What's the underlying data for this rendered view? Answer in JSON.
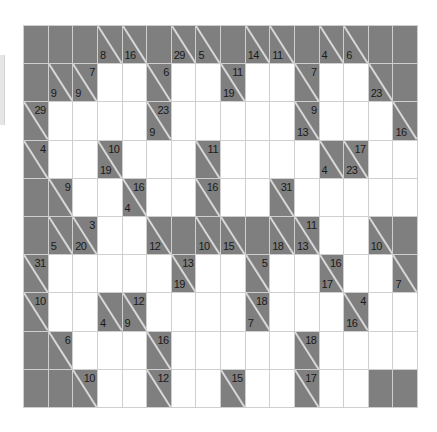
{
  "puzzle": {
    "type": "kakuro",
    "rows": 10,
    "cols": 16,
    "colors": {
      "block": "#7f7f7f",
      "white": "#ffffff",
      "gridline": "#cfcfcf"
    },
    "legend": "Each row is a list of 16 cells. 'B' = blank black cell, 'W' = empty white entry cell, object = clue cell with optional down/right sums.",
    "grid": [
      [
        "B",
        "B",
        "B",
        {
          "down": 8
        },
        {
          "down": 16
        },
        "B",
        {
          "down": 29
        },
        {
          "down": 5
        },
        "B",
        {
          "down": 14
        },
        {
          "down": 11
        },
        "B",
        {
          "down": 4
        },
        {
          "down": 6
        },
        "B",
        "B"
      ],
      [
        "B",
        {
          "down": 9
        },
        {
          "down": 9,
          "right": 7
        },
        "W",
        "W",
        {
          "right": 6
        },
        "W",
        "W",
        {
          "down": 19,
          "right": 11
        },
        "W",
        "W",
        {
          "right": 7
        },
        "W",
        "W",
        {
          "down": 23
        },
        "B"
      ],
      [
        {
          "right": 29
        },
        "W",
        "W",
        "W",
        "W",
        {
          "down": 9,
          "right": 23
        },
        "W",
        "W",
        "W",
        "W",
        "W",
        {
          "down": 13,
          "right": 9
        },
        "W",
        "W",
        "W",
        {
          "down": 16
        }
      ],
      [
        {
          "right": 4
        },
        "W",
        "W",
        {
          "down": 19,
          "right": 10
        },
        "W",
        "W",
        "W",
        {
          "right": 11
        },
        "W",
        "W",
        "W",
        "W",
        {
          "down": 4
        },
        {
          "down": 23,
          "right": 17
        },
        "W",
        "W"
      ],
      [
        "B",
        {
          "right": 9
        },
        "W",
        "W",
        {
          "down": 4,
          "right": 16
        },
        "W",
        "W",
        {
          "right": 16
        },
        "W",
        "W",
        {
          "right": 31
        },
        "W",
        "W",
        "W",
        "W",
        "W"
      ],
      [
        "B",
        {
          "down": 5
        },
        {
          "down": 20,
          "right": 3
        },
        "W",
        "W",
        {
          "down": 12
        },
        "B",
        {
          "down": 10
        },
        {
          "down": 15
        },
        "B",
        {
          "down": 18
        },
        {
          "down": 13,
          "right": 11
        },
        "W",
        "W",
        {
          "down": 10
        },
        "B"
      ],
      [
        {
          "right": 31
        },
        "W",
        "W",
        "W",
        "W",
        "W",
        {
          "down": 19,
          "right": 13
        },
        "W",
        "W",
        {
          "right": 5
        },
        "W",
        "W",
        {
          "down": 17,
          "right": 16
        },
        "W",
        "W",
        {
          "down": 7
        }
      ],
      [
        {
          "right": 10
        },
        "W",
        "W",
        {
          "down": 4
        },
        {
          "down": 9,
          "right": 12
        },
        "W",
        "W",
        "W",
        "W",
        {
          "down": 7,
          "right": 18
        },
        "W",
        "W",
        "W",
        {
          "down": 16,
          "right": 4
        },
        "W",
        "W"
      ],
      [
        "B",
        {
          "right": 6
        },
        "W",
        "W",
        "W",
        {
          "right": 16
        },
        "W",
        "W",
        "W",
        "W",
        "W",
        {
          "right": 18
        },
        "W",
        "W",
        "W",
        "W"
      ],
      [
        "B",
        "B",
        {
          "right": 10
        },
        "W",
        "W",
        {
          "right": 12
        },
        "W",
        "W",
        {
          "right": 15
        },
        "W",
        "W",
        {
          "right": 17
        },
        "W",
        "W",
        "B",
        "B"
      ]
    ]
  }
}
